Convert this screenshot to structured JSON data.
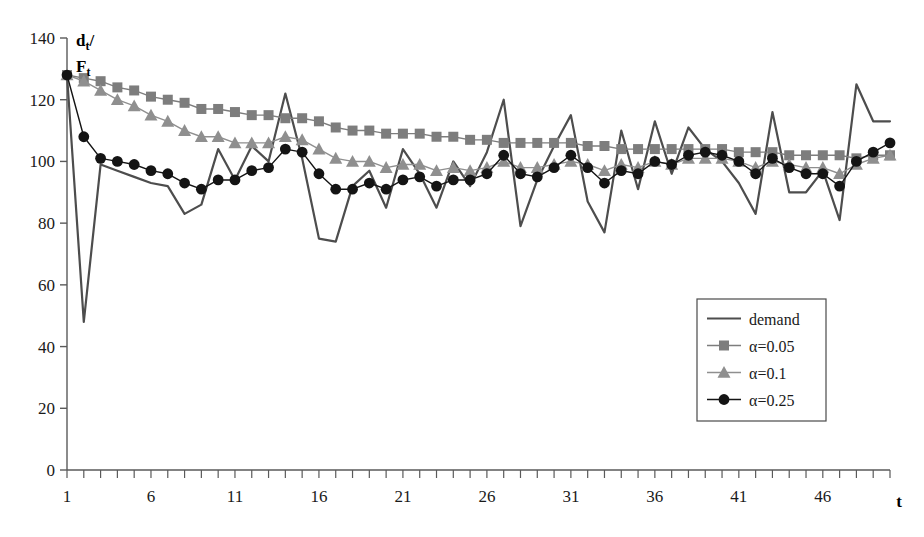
{
  "chart_data": {
    "type": "line",
    "title": "",
    "xlabel": "t",
    "ylabel": "d_t / F_t",
    "ylabel_main": "d",
    "ylabel_main_sub": "t",
    "ylabel_second": "F",
    "ylabel_second_sub": "t",
    "xlim": [
      1,
      50
    ],
    "ylim": [
      0,
      140
    ],
    "ytick_values": [
      0,
      20,
      40,
      60,
      80,
      100,
      120,
      140
    ],
    "ytick_labels": [
      "0",
      "20",
      "40",
      "60",
      "80",
      "100",
      "120",
      "140"
    ],
    "xtick_step": 1,
    "xtick_labels": [
      "1",
      "6",
      "11",
      "16",
      "21",
      "26",
      "31",
      "36",
      "41",
      "46"
    ],
    "xtick_label_values": [
      1,
      6,
      11,
      16,
      21,
      26,
      31,
      36,
      41,
      46
    ],
    "grid": false,
    "legend_position": "center-right",
    "x": [
      1,
      2,
      3,
      4,
      5,
      6,
      7,
      8,
      9,
      10,
      11,
      12,
      13,
      14,
      15,
      16,
      17,
      18,
      19,
      20,
      21,
      22,
      23,
      24,
      25,
      26,
      27,
      28,
      29,
      30,
      31,
      32,
      33,
      34,
      35,
      36,
      37,
      38,
      39,
      40,
      41,
      42,
      43,
      44,
      45,
      46,
      47,
      48,
      49,
      50
    ],
    "series": [
      {
        "name": "demand",
        "color": "#4d4d4d",
        "marker": "none",
        "values": [
          128,
          48,
          99,
          97,
          95,
          93,
          92,
          83,
          86,
          104,
          94,
          105,
          100,
          122,
          101,
          75,
          74,
          92,
          97,
          85,
          104,
          96,
          85,
          100,
          92,
          103,
          120,
          79,
          94,
          105,
          115,
          87,
          77,
          110,
          91,
          113,
          96,
          111,
          104,
          100,
          93,
          83,
          116,
          90,
          90,
          97,
          81,
          125,
          113,
          113
        ]
      },
      {
        "name": "α=0.05",
        "color": "#7d7d7d",
        "marker": "square",
        "values": [
          128,
          127,
          126,
          124,
          123,
          121,
          120,
          119,
          117,
          117,
          116,
          115,
          115,
          114,
          114,
          113,
          111,
          110,
          110,
          109,
          109,
          109,
          108,
          108,
          107,
          107,
          106,
          106,
          106,
          106,
          106,
          105,
          105,
          104,
          104,
          104,
          104,
          104,
          104,
          104,
          103,
          103,
          103,
          102,
          102,
          102,
          102,
          101,
          102,
          102
        ]
      },
      {
        "name": "α=0.1",
        "color": "#8f8f8f",
        "marker": "triangle",
        "values": [
          128,
          126,
          123,
          120,
          118,
          115,
          113,
          110,
          108,
          108,
          106,
          106,
          106,
          108,
          107,
          104,
          101,
          100,
          100,
          98,
          99,
          99,
          97,
          98,
          97,
          98,
          100,
          98,
          98,
          99,
          100,
          99,
          97,
          99,
          98,
          100,
          99,
          101,
          101,
          101,
          100,
          98,
          100,
          99,
          98,
          98,
          96,
          99,
          101,
          102
        ]
      },
      {
        "name": "α=0.25",
        "color": "#141414",
        "marker": "circle",
        "values": [
          128,
          108,
          101,
          100,
          99,
          97,
          96,
          93,
          91,
          94,
          94,
          97,
          98,
          104,
          103,
          96,
          91,
          91,
          93,
          91,
          94,
          95,
          92,
          94,
          94,
          96,
          102,
          96,
          95,
          98,
          102,
          98,
          93,
          97,
          96,
          100,
          99,
          102,
          103,
          102,
          100,
          96,
          101,
          98,
          96,
          96,
          92,
          100,
          103,
          106
        ]
      }
    ],
    "legend": [
      {
        "label": "demand",
        "marker": "none",
        "color": "#4d4d4d"
      },
      {
        "label": "α=0.05",
        "marker": "square",
        "color": "#7d7d7d"
      },
      {
        "label": "α=0.1",
        "marker": "triangle",
        "color": "#8f8f8f"
      },
      {
        "label": "α=0.25",
        "marker": "circle",
        "color": "#141414"
      }
    ]
  }
}
